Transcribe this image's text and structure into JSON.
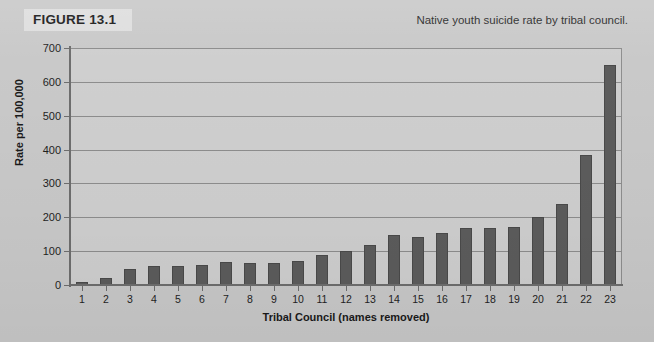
{
  "figure": {
    "label": "FIGURE 13.1",
    "caption": "Native youth suicide rate by tribal council."
  },
  "chart_data": {
    "type": "bar",
    "title": "Native youth suicide rate by tribal council.",
    "xlabel": "Tribal Council (names removed)",
    "ylabel": "Rate per 100,000",
    "categories": [
      "1",
      "2",
      "3",
      "4",
      "5",
      "6",
      "7",
      "8",
      "9",
      "10",
      "11",
      "12",
      "13",
      "14",
      "15",
      "16",
      "17",
      "18",
      "19",
      "20",
      "21",
      "22",
      "23"
    ],
    "values": [
      10,
      22,
      48,
      56,
      57,
      60,
      67,
      66,
      66,
      70,
      90,
      100,
      118,
      147,
      142,
      155,
      168,
      168,
      172,
      200,
      240,
      385,
      650
    ],
    "ylim": [
      0,
      700
    ],
    "yticks": [
      0,
      100,
      200,
      300,
      400,
      500,
      600,
      700
    ],
    "ytick_labels": [
      "0",
      "100",
      "200",
      "300",
      "400",
      "500",
      "600",
      "700"
    ],
    "grid": true,
    "legend": "none",
    "bar_color": "#5c5c5c",
    "plot_background": "#cfcfcf"
  }
}
